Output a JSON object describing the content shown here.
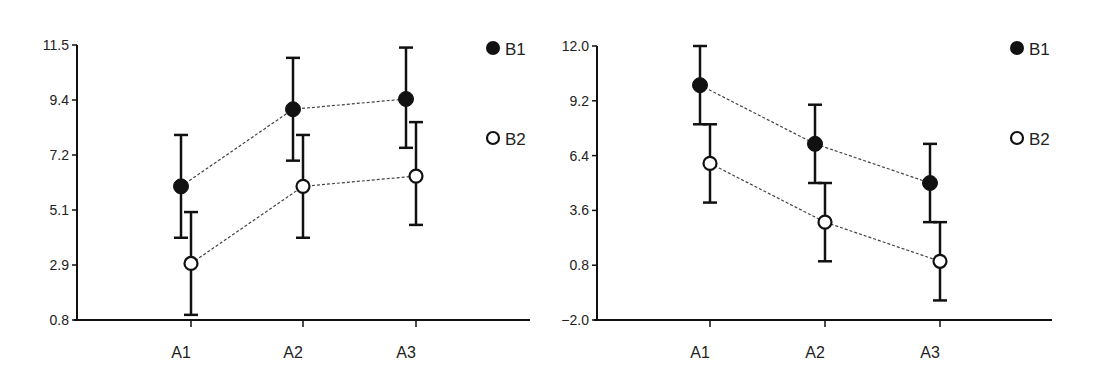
{
  "chart_data": [
    {
      "type": "line",
      "title": "",
      "xlabel": "",
      "ylabel": "",
      "categories": [
        "A1",
        "A2",
        "A3"
      ],
      "yticks": [
        "11.5",
        "9.4",
        "7.2",
        "5.1",
        "2.9",
        "0.8"
      ],
      "ylim": [
        0.8,
        11.5
      ],
      "grid": false,
      "legend_position": "right",
      "error_bars": true,
      "series": [
        {
          "name": "B1",
          "marker": "filled-circle",
          "values": [
            6.0,
            9.0,
            9.4
          ],
          "err_low": [
            4.0,
            7.0,
            7.5
          ],
          "err_high": [
            8.0,
            11.0,
            11.4
          ]
        },
        {
          "name": "B2",
          "marker": "open-circle",
          "values": [
            3.0,
            6.0,
            6.4
          ],
          "err_low": [
            1.0,
            4.0,
            4.5
          ],
          "err_high": [
            5.0,
            8.0,
            8.5
          ]
        }
      ]
    },
    {
      "type": "line",
      "title": "",
      "xlabel": "",
      "ylabel": "",
      "categories": [
        "A1",
        "A2",
        "A3"
      ],
      "yticks": [
        "12.0",
        "9.2",
        "6.4",
        "3.6",
        "0.8",
        "−2.0"
      ],
      "ylim": [
        -2.0,
        12.0
      ],
      "grid": false,
      "legend_position": "right",
      "error_bars": true,
      "series": [
        {
          "name": "B1",
          "marker": "filled-circle",
          "values": [
            10.0,
            7.0,
            5.0
          ],
          "err_low": [
            8.0,
            5.0,
            3.0
          ],
          "err_high": [
            12.0,
            9.0,
            7.0
          ]
        },
        {
          "name": "B2",
          "marker": "open-circle",
          "values": [
            6.0,
            3.0,
            1.0
          ],
          "err_low": [
            4.0,
            1.0,
            -1.0
          ],
          "err_high": [
            8.0,
            5.0,
            3.0
          ]
        }
      ]
    }
  ],
  "legend": {
    "b1": "B1",
    "b2": "B2"
  }
}
